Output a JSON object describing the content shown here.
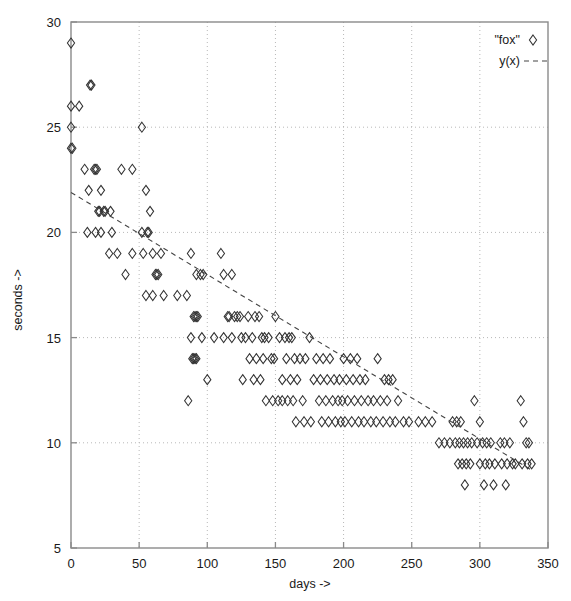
{
  "chart_data": {
    "type": "scatter",
    "title": "",
    "xlabel": "days ->",
    "ylabel": "seconds ->",
    "xlim": [
      0,
      350
    ],
    "ylim": [
      5,
      30
    ],
    "xticks": [
      0,
      50,
      100,
      150,
      200,
      250,
      300,
      350
    ],
    "yticks": [
      5,
      10,
      15,
      20,
      25,
      30
    ],
    "grid": true,
    "grid_style": "dotted",
    "legend_position": "top-right",
    "legend": [
      {
        "label": "\"fox\"",
        "marker": "diamond",
        "style": "points"
      },
      {
        "label": "y(x)",
        "marker": "dashed-line",
        "style": "lines"
      }
    ],
    "series": [
      {
        "name": "\"fox\"",
        "marker": "diamond",
        "points": [
          [
            0,
            29
          ],
          [
            0,
            26
          ],
          [
            0,
            25
          ],
          [
            0,
            24
          ],
          [
            1,
            24
          ],
          [
            6,
            26
          ],
          [
            14,
            27
          ],
          [
            15,
            27
          ],
          [
            10,
            23
          ],
          [
            17,
            23
          ],
          [
            18,
            23
          ],
          [
            19,
            23
          ],
          [
            22,
            22
          ],
          [
            13,
            22
          ],
          [
            20,
            21
          ],
          [
            21,
            21
          ],
          [
            24,
            21
          ],
          [
            25,
            21
          ],
          [
            29,
            21
          ],
          [
            12,
            20
          ],
          [
            18,
            20
          ],
          [
            22,
            20
          ],
          [
            30,
            20
          ],
          [
            28,
            19
          ],
          [
            34,
            19
          ],
          [
            45,
            19
          ],
          [
            40,
            18
          ],
          [
            37,
            23
          ],
          [
            45,
            23
          ],
          [
            52,
            25
          ],
          [
            55,
            22
          ],
          [
            58,
            21
          ],
          [
            52,
            20
          ],
          [
            56,
            20
          ],
          [
            57,
            20
          ],
          [
            53,
            19
          ],
          [
            60,
            19
          ],
          [
            66,
            19
          ],
          [
            62,
            18
          ],
          [
            63,
            18
          ],
          [
            64,
            18
          ],
          [
            55,
            17
          ],
          [
            60,
            17
          ],
          [
            68,
            17
          ],
          [
            88,
            19
          ],
          [
            92,
            18
          ],
          [
            95,
            18
          ],
          [
            97,
            18
          ],
          [
            78,
            17
          ],
          [
            85,
            17
          ],
          [
            90,
            16
          ],
          [
            91,
            16
          ],
          [
            92,
            16
          ],
          [
            93,
            16
          ],
          [
            88,
            15
          ],
          [
            96,
            15
          ],
          [
            105,
            15
          ],
          [
            89,
            14
          ],
          [
            90,
            14
          ],
          [
            91,
            14
          ],
          [
            92,
            14
          ],
          [
            100,
            13
          ],
          [
            86,
            12
          ],
          [
            110,
            19
          ],
          [
            112,
            18
          ],
          [
            118,
            18
          ],
          [
            115,
            16
          ],
          [
            116,
            16
          ],
          [
            120,
            16
          ],
          [
            122,
            16
          ],
          [
            124,
            16
          ],
          [
            112,
            15
          ],
          [
            118,
            15
          ],
          [
            125,
            15
          ],
          [
            130,
            16
          ],
          [
            135,
            16
          ],
          [
            138,
            16
          ],
          [
            128,
            15
          ],
          [
            133,
            15
          ],
          [
            140,
            15
          ],
          [
            142,
            15
          ],
          [
            145,
            15
          ],
          [
            131,
            14
          ],
          [
            136,
            14
          ],
          [
            141,
            14
          ],
          [
            147,
            14
          ],
          [
            126,
            13
          ],
          [
            134,
            13
          ],
          [
            139,
            13
          ],
          [
            143,
            12
          ],
          [
            148,
            12
          ],
          [
            152,
            12
          ],
          [
            155,
            12
          ],
          [
            150,
            16
          ],
          [
            153,
            15
          ],
          [
            157,
            15
          ],
          [
            160,
            15
          ],
          [
            162,
            15
          ],
          [
            149,
            14
          ],
          [
            158,
            14
          ],
          [
            164,
            14
          ],
          [
            168,
            14
          ],
          [
            172,
            14
          ],
          [
            155,
            13
          ],
          [
            161,
            13
          ],
          [
            166,
            13
          ],
          [
            159,
            12
          ],
          [
            163,
            12
          ],
          [
            170,
            12
          ],
          [
            165,
            11
          ],
          [
            171,
            11
          ],
          [
            176,
            11
          ],
          [
            175,
            15
          ],
          [
            180,
            14
          ],
          [
            185,
            14
          ],
          [
            190,
            14
          ],
          [
            178,
            13
          ],
          [
            183,
            13
          ],
          [
            188,
            13
          ],
          [
            193,
            13
          ],
          [
            182,
            12
          ],
          [
            187,
            12
          ],
          [
            192,
            12
          ],
          [
            196,
            12
          ],
          [
            184,
            11
          ],
          [
            189,
            11
          ],
          [
            194,
            11
          ],
          [
            198,
            11
          ],
          [
            200,
            14
          ],
          [
            205,
            14
          ],
          [
            210,
            14
          ],
          [
            197,
            13
          ],
          [
            202,
            13
          ],
          [
            207,
            13
          ],
          [
            212,
            13
          ],
          [
            216,
            13
          ],
          [
            199,
            12
          ],
          [
            203,
            12
          ],
          [
            208,
            12
          ],
          [
            213,
            12
          ],
          [
            218,
            12
          ],
          [
            201,
            11
          ],
          [
            206,
            11
          ],
          [
            211,
            11
          ],
          [
            215,
            11
          ],
          [
            220,
            11
          ],
          [
            225,
            14
          ],
          [
            230,
            13
          ],
          [
            233,
            13
          ],
          [
            236,
            13
          ],
          [
            222,
            12
          ],
          [
            227,
            12
          ],
          [
            232,
            12
          ],
          [
            224,
            11
          ],
          [
            229,
            11
          ],
          [
            234,
            11
          ],
          [
            238,
            11
          ],
          [
            240,
            12
          ],
          [
            244,
            11
          ],
          [
            248,
            11
          ],
          [
            255,
            11
          ],
          [
            260,
            11
          ],
          [
            265,
            11
          ],
          [
            270,
            10
          ],
          [
            274,
            10
          ],
          [
            278,
            10
          ],
          [
            280,
            11
          ],
          [
            283,
            11
          ],
          [
            286,
            11
          ],
          [
            282,
            10
          ],
          [
            285,
            10
          ],
          [
            288,
            10
          ],
          [
            291,
            10
          ],
          [
            294,
            10
          ],
          [
            284,
            9
          ],
          [
            287,
            9
          ],
          [
            290,
            9
          ],
          [
            293,
            9
          ],
          [
            289,
            8
          ],
          [
            296,
            12
          ],
          [
            300,
            11
          ],
          [
            298,
            10
          ],
          [
            302,
            10
          ],
          [
            305,
            10
          ],
          [
            308,
            10
          ],
          [
            300,
            9
          ],
          [
            304,
            9
          ],
          [
            307,
            9
          ],
          [
            311,
            9
          ],
          [
            303,
            8
          ],
          [
            310,
            8
          ],
          [
            315,
            10
          ],
          [
            318,
            10
          ],
          [
            322,
            10
          ],
          [
            316,
            9
          ],
          [
            320,
            9
          ],
          [
            324,
            9
          ],
          [
            319,
            8
          ],
          [
            326,
            9
          ],
          [
            330,
            12
          ],
          [
            332,
            11
          ],
          [
            334,
            10
          ],
          [
            336,
            10
          ],
          [
            331,
            9
          ],
          [
            335,
            9
          ],
          [
            338,
            9
          ]
        ]
      }
    ],
    "fit_line": {
      "name": "y(x)",
      "style": "dashed",
      "x_start": 0,
      "y_start": 21.9,
      "x_end": 338,
      "y_end": 8.7
    }
  },
  "axes": {
    "x_tick_labels": [
      "0",
      "50",
      "100",
      "150",
      "200",
      "250",
      "300",
      "350"
    ],
    "y_tick_labels": [
      "5",
      "10",
      "15",
      "20",
      "25",
      "30"
    ],
    "x_axis_label": "days ->",
    "y_axis_label": "seconds ->"
  },
  "legend": {
    "entry_one_label": "\"fox\"",
    "entry_two_label": "y(x)"
  },
  "colors": {
    "background": "#ffffff",
    "frame": "#8a8a8a",
    "grid": "#b8b8b8",
    "marker": "#333333",
    "fit_line": "#444444",
    "text": "#1a1a1a"
  }
}
